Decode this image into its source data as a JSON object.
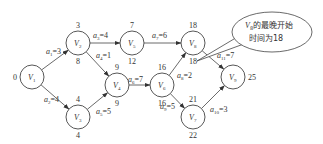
{
  "nodes": [
    {
      "id": "V1",
      "letter": "V",
      "sub": "1",
      "x": 32,
      "y": 77,
      "top": "",
      "bottom": "",
      "left": "0",
      "right": ""
    },
    {
      "id": "V2",
      "letter": "V",
      "sub": "2",
      "x": 78,
      "y": 43,
      "top": "3",
      "bottom": "8",
      "left": "",
      "right": ""
    },
    {
      "id": "V3",
      "letter": "V",
      "sub": "3",
      "x": 78,
      "y": 117,
      "top": "4",
      "bottom": "4",
      "left": "",
      "right": ""
    },
    {
      "id": "V4",
      "letter": "V",
      "sub": "4",
      "x": 117,
      "y": 85,
      "top": "9",
      "bottom": "9",
      "left": "",
      "right": ""
    },
    {
      "id": "V5",
      "letter": "V",
      "sub": "5",
      "x": 132,
      "y": 43,
      "top": "7",
      "bottom": "12",
      "left": "",
      "right": ""
    },
    {
      "id": "V6",
      "letter": "V",
      "sub": "6",
      "x": 162,
      "y": 85,
      "top": "16",
      "bottom": "16",
      "left": "",
      "right": ""
    },
    {
      "id": "V7",
      "letter": "V",
      "sub": "7",
      "x": 193,
      "y": 117,
      "top": "21",
      "bottom": "22",
      "left": "",
      "right": ""
    },
    {
      "id": "V8",
      "letter": "V",
      "sub": "8",
      "x": 193,
      "y": 43,
      "top": "18",
      "bottom": "18",
      "left": "",
      "right": ""
    },
    {
      "id": "V9",
      "letter": "V",
      "sub": "9",
      "x": 233,
      "y": 77,
      "top": "",
      "bottom": "",
      "left": "",
      "right": "25"
    }
  ],
  "edges": [
    {
      "from": "V1",
      "to": "V2",
      "name": "a",
      "sub": "1",
      "weight": "3"
    },
    {
      "from": "V1",
      "to": "V3",
      "name": "a",
      "sub": "2",
      "weight": "4"
    },
    {
      "from": "V2",
      "to": "V5",
      "name": "a",
      "sub": "3",
      "weight": "4"
    },
    {
      "from": "V2",
      "to": "V4",
      "name": "a",
      "sub": "4",
      "weight": "1"
    },
    {
      "from": "V3",
      "to": "V4",
      "name": "a",
      "sub": "5",
      "weight": "5"
    },
    {
      "from": "V4",
      "to": "V6",
      "name": "a",
      "sub": "6",
      "weight": "7"
    },
    {
      "from": "V5",
      "to": "V8",
      "name": "a",
      "sub": "7",
      "weight": "6"
    },
    {
      "from": "V6",
      "to": "V8",
      "name": "a",
      "sub": "8",
      "weight": "2"
    },
    {
      "from": "V6",
      "to": "V7",
      "name": "a",
      "sub": "9",
      "weight": "5"
    },
    {
      "from": "V7",
      "to": "V9",
      "name": "a",
      "sub": "10",
      "weight": "3"
    },
    {
      "from": "V8",
      "to": "V9",
      "name": "a",
      "sub": "11",
      "weight": "7"
    }
  ],
  "callout": {
    "line1_letter": "V",
    "line1_sub": "8",
    "line1_rest": "的最晚开始",
    "line2": "时间为18"
  }
}
